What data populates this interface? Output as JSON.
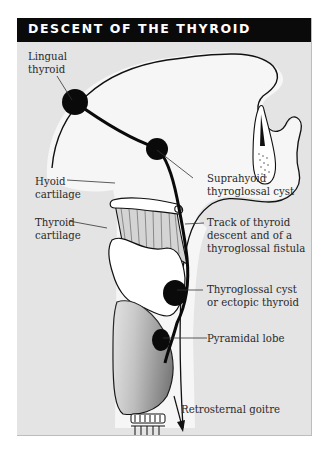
{
  "diagram": {
    "title": "DESCENT OF THE THYROID",
    "labels": {
      "lingual": [
        "Lingual",
        "thyroid"
      ],
      "hyoid": [
        "Hyoid",
        "cartilage"
      ],
      "thyroid_cartilage": [
        "Thyroid",
        "cartilage"
      ],
      "suprahyoid": [
        "Suprahyoid",
        "thyroglossal cyst"
      ],
      "track": [
        "Track of thyroid",
        "descent and of a",
        "thyroglossal fistula"
      ],
      "cyst": [
        "Thyroglossal cyst",
        "or ectopic thyroid"
      ],
      "pyramidal": [
        "Pyramidal lobe"
      ],
      "retrosternal": [
        "Retrosternal goitre"
      ]
    },
    "colors": {
      "header_bg": "#0a0a0a",
      "panel_bg": "#e4e4e4",
      "tissue": "#f6f6f6",
      "thyroid_gland": "#a8a8a8",
      "ink": "#111111"
    }
  }
}
